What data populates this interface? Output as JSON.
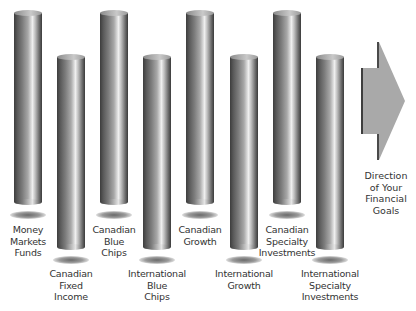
{
  "diagram": {
    "pillars": [
      {
        "id": "money-markets-funds",
        "lines": [
          "Money",
          "Markets",
          "Funds"
        ],
        "height": "tall"
      },
      {
        "id": "canadian-fixed-income",
        "lines": [
          "Canadian",
          "Fixed",
          "Income"
        ],
        "height": "short"
      },
      {
        "id": "canadian-blue-chips",
        "lines": [
          "Canadian",
          "Blue",
          "Chips"
        ],
        "height": "tall"
      },
      {
        "id": "international-blue-chips",
        "lines": [
          "International",
          "Blue",
          "Chips"
        ],
        "height": "short"
      },
      {
        "id": "canadian-growth",
        "lines": [
          "Canadian",
          "Growth"
        ],
        "height": "tall"
      },
      {
        "id": "international-growth",
        "lines": [
          "International",
          "Growth"
        ],
        "height": "short"
      },
      {
        "id": "canadian-specialty-investments",
        "lines": [
          "Canadian",
          "Specialty",
          "Investments"
        ],
        "height": "tall"
      },
      {
        "id": "international-specialty-investments",
        "lines": [
          "International",
          "Specialty",
          "Investments"
        ],
        "height": "short"
      }
    ],
    "arrow": {
      "icon": "right-arrow-icon",
      "color": "#a9a9a9",
      "edge_color": "#4a4a4a",
      "label_lines": [
        "Direction",
        "of Your",
        "Financial",
        "Goals"
      ]
    },
    "colors": {
      "background": "#ffffff",
      "text": "#333333"
    }
  }
}
